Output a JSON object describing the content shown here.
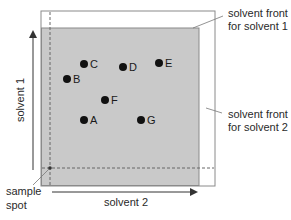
{
  "diagram": {
    "type": "two-dimensional thin-layer chromatography",
    "colors": {
      "plate_border": "#8a8a8a",
      "developed_region": "#c9c9c9",
      "plate_background": "#ffffff",
      "spot": "#111111",
      "arrow": "#333333",
      "dashed_line": "#666666"
    },
    "axes": {
      "vertical_label": "solvent 1",
      "horizontal_label": "solvent 2"
    },
    "callouts": {
      "solvent_front_1_line1": "solvent front",
      "solvent_front_1_line2": "for solvent 1",
      "solvent_front_2_line1": "solvent front",
      "solvent_front_2_line2": "for solvent 2",
      "sample_spot_line1": "sample",
      "sample_spot_line2": "spot"
    },
    "spots": [
      {
        "label": "A",
        "x": 84,
        "y": 120
      },
      {
        "label": "B",
        "x": 67,
        "y": 79
      },
      {
        "label": "C",
        "x": 84,
        "y": 64
      },
      {
        "label": "D",
        "x": 123,
        "y": 67
      },
      {
        "label": "E",
        "x": 159,
        "y": 63
      },
      {
        "label": "F",
        "x": 105,
        "y": 100
      },
      {
        "label": "G",
        "x": 141,
        "y": 120
      }
    ]
  }
}
